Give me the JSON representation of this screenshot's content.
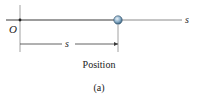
{
  "figure": {
    "axis_label": "s",
    "origin_label": "O",
    "dimension_label": "s",
    "caption": "Position",
    "subfigure_label": "(a)"
  },
  "colors": {
    "axis": "#3a3a3a",
    "particle_fill": "#7fa3bf",
    "particle_highlight": "#dce9f3",
    "particle_stroke": "#2e4e66",
    "text": "#222222"
  }
}
